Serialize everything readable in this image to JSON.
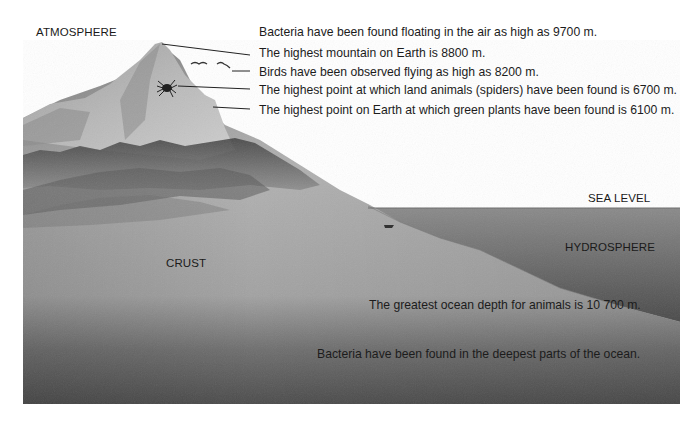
{
  "zones": {
    "atmosphere": "ATMOSPHERE",
    "crust": "CRUST",
    "sea_level": "SEA LEVEL",
    "hydrosphere": "HYDROSPHERE"
  },
  "facts": [
    {
      "id": "bacteria-air",
      "text": "Bacteria have been found floating in the air as high as 9700 m.",
      "altitude_m": 9700
    },
    {
      "id": "highest-mountain",
      "text": "The highest mountain on Earth is 8800 m.",
      "altitude_m": 8800
    },
    {
      "id": "birds",
      "text": "Birds have been observed flying as high as 8200 m.",
      "altitude_m": 8200
    },
    {
      "id": "spiders",
      "text": "The highest point at which land animals (spiders) have been found is 6700 m.",
      "altitude_m": 6700
    },
    {
      "id": "green-plants",
      "text": "The highest point on Earth at which green plants have been found is 6100 m.",
      "altitude_m": 6100
    },
    {
      "id": "ocean-animals",
      "text": "The greatest ocean depth for animals is 10 700 m.",
      "depth_m": 10700
    },
    {
      "id": "bacteria-ocean",
      "text": "Bacteria have been found in the deepest parts of the ocean."
    }
  ],
  "colors": {
    "land_light": "#b4b4b4",
    "land_dark": "#5e5e5e",
    "water": "#7a7a7a",
    "water_deep": "#4a4a4a",
    "forest": "#3c3c3c",
    "text": "#1c1c1c",
    "background": "#ffffff"
  }
}
